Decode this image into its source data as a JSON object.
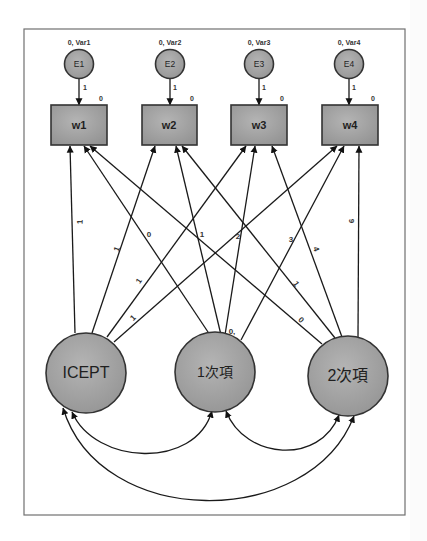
{
  "diagram": {
    "type": "path_diagram",
    "title": "",
    "colors": {
      "node_fill": "#9e9e9e",
      "node_fill_light": "#b4b4b4",
      "stroke": "#333333",
      "frame": "#707070",
      "text": "#1f1f1f"
    },
    "error_nodes": [
      {
        "id": "E1",
        "label": "E1",
        "param": "0, Var1",
        "path_weight": "1"
      },
      {
        "id": "E2",
        "label": "E2",
        "param": "0, Var2",
        "path_weight": "1"
      },
      {
        "id": "E3",
        "label": "E3",
        "param": "0, Var3",
        "path_weight": "1"
      },
      {
        "id": "E4",
        "label": "E4",
        "param": "0, Var4",
        "path_weight": "1"
      }
    ],
    "observed": [
      {
        "id": "w1",
        "label": "w1",
        "intercept": "0"
      },
      {
        "id": "w2",
        "label": "w2",
        "intercept": "0"
      },
      {
        "id": "w3",
        "label": "w3",
        "intercept": "0"
      },
      {
        "id": "w4",
        "label": "w4",
        "intercept": "0"
      }
    ],
    "latent": [
      {
        "id": "ICEPT",
        "label": "ICEPT"
      },
      {
        "id": "linear",
        "label": "1次項"
      },
      {
        "id": "quadratic",
        "label": "2次項"
      }
    ],
    "loadings": {
      "ICEPT": [
        "1",
        "1",
        "1",
        "1"
      ],
      "linear": [
        "0",
        "1",
        "2",
        "3"
      ],
      "quadratic": [
        "0",
        "1",
        "4",
        "9"
      ]
    },
    "extra_label": "0,",
    "covariances": [
      {
        "from": "ICEPT",
        "to": "1次項"
      },
      {
        "from": "1次項",
        "to": "2次項"
      },
      {
        "from": "ICEPT",
        "to": "2次項"
      }
    ]
  }
}
